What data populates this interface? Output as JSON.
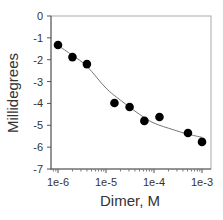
{
  "chart_data": {
    "type": "scatter",
    "title": "",
    "xlabel": "Dimer, M",
    "ylabel": "Millidegrees",
    "xscale": "log",
    "xlim": [
      1e-06,
      0.001
    ],
    "ylim": [
      -7,
      0
    ],
    "grid": false,
    "legend": null,
    "x_ticks": [
      "1e-6",
      "1e-5",
      "1e-4",
      "1e-3"
    ],
    "y_ticks": [
      "0",
      "-1",
      "-2",
      "-3",
      "-4",
      "-5",
      "-6",
      "-7"
    ],
    "series": [
      {
        "name": "data",
        "kind": "scatter",
        "marker": "filled-circle",
        "color": "#000000",
        "x": [
          1e-06,
          2e-06,
          4e-06,
          1.5e-05,
          3.1e-05,
          6.3e-05,
          0.00013,
          0.00051,
          0.001
        ],
        "y": [
          -1.33,
          -1.88,
          -2.2,
          -3.98,
          -4.16,
          -4.8,
          -4.62,
          -5.35,
          -5.76
        ]
      },
      {
        "name": "fit",
        "kind": "line",
        "color": "#777777",
        "x": [
          1e-06,
          2e-06,
          4e-06,
          1e-05,
          2e-05,
          5e-05,
          0.0001,
          0.00025,
          0.0005,
          0.001
        ],
        "y": [
          -1.35,
          -1.8,
          -2.3,
          -3.3,
          -3.85,
          -4.5,
          -4.9,
          -5.2,
          -5.4,
          -5.55
        ]
      }
    ]
  }
}
